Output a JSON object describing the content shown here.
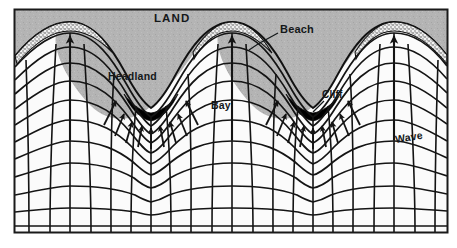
{
  "figure": {
    "frame": {
      "x": 14,
      "y": 9,
      "width": 434,
      "height": 224,
      "border_color": "#1a1a1a",
      "border_width": 2
    },
    "colors": {
      "land": "#b4b4b4",
      "land_edge": "#8f8f8f",
      "sea": "#fbfbfb",
      "beach": "#efefef",
      "beach_dot": "#4a4a4a",
      "cliff": "#000000",
      "line": "#141414",
      "page": "#ffffff",
      "text": "#14181a"
    },
    "labels": [
      {
        "id": "land",
        "text": "LAND",
        "name": "label-land"
      },
      {
        "id": "beach",
        "text": "Beach",
        "name": "label-beach"
      },
      {
        "id": "headland",
        "text": "Headland",
        "name": "label-headland"
      },
      {
        "id": "bay",
        "text": "Bay",
        "name": "label-bay"
      },
      {
        "id": "cliff",
        "text": "Cliff",
        "name": "label-cliff"
      },
      {
        "id": "wave",
        "text": "Wave",
        "name": "label-wave"
      }
    ],
    "leaders": [
      {
        "from": "beach",
        "x1": 278,
        "y1": 33,
        "x2": 248,
        "y2": 50
      },
      {
        "from": "cliff",
        "x1": 324,
        "y1": 101,
        "x2": 312,
        "y2": 113
      }
    ],
    "geometry": {
      "headland_centers_x": [
        70,
        232,
        394
      ],
      "bay_centers_x": [
        151,
        313
      ],
      "crest_count": 11,
      "ray_count": 19,
      "arrow_up_x": [
        70,
        232,
        394
      ],
      "arrow_converge_bays": 2,
      "arrows_per_bay": 9
    }
  }
}
